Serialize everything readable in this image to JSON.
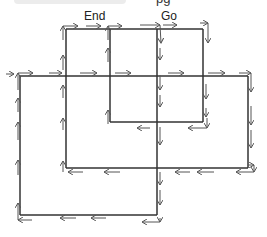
{
  "header": {
    "partial_text": "pg"
  },
  "labels": {
    "end": "End",
    "go": "Go"
  },
  "diagram": {
    "edges_count": 13,
    "arrow_directions": [
      "right",
      "down",
      "left",
      "up"
    ]
  }
}
